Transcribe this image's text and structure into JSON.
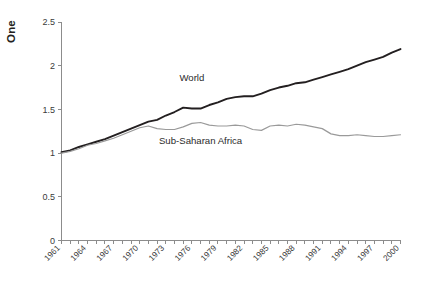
{
  "chart_data": {
    "type": "line",
    "title": "",
    "xlabel": "",
    "ylabel": "One",
    "ylim": [
      0,
      2.5
    ],
    "xlim": [
      1961,
      2000
    ],
    "grid": false,
    "legend_position": "inline-annotation",
    "ytick_labels": [
      "0",
      "0.5",
      "1",
      "1.5",
      "2",
      "2.5"
    ],
    "ytick_values": [
      0,
      0.5,
      1,
      1.5,
      2,
      2.5
    ],
    "x": [
      1961,
      1962,
      1963,
      1964,
      1965,
      1966,
      1967,
      1968,
      1969,
      1970,
      1971,
      1972,
      1973,
      1974,
      1975,
      1976,
      1977,
      1978,
      1979,
      1980,
      1981,
      1982,
      1983,
      1984,
      1985,
      1986,
      1987,
      1988,
      1989,
      1990,
      1991,
      1992,
      1993,
      1994,
      1995,
      1996,
      1997,
      1998,
      1999,
      2000
    ],
    "xtick_labels": [
      "1961",
      "1964",
      "1967",
      "1970",
      "1973",
      "1976",
      "1979",
      "1982",
      "1985",
      "1988",
      "1991",
      "1994",
      "1997",
      "2000"
    ],
    "xtick_values": [
      1961,
      1964,
      1967,
      1970,
      1973,
      1976,
      1979,
      1982,
      1985,
      1988,
      1991,
      1994,
      1997,
      2000
    ],
    "series": [
      {
        "name": "World",
        "color": "#231f20",
        "width": 1.9,
        "label_x": 1976,
        "label_y": 1.82,
        "values": [
          1.01,
          1.03,
          1.07,
          1.1,
          1.13,
          1.16,
          1.2,
          1.24,
          1.28,
          1.32,
          1.36,
          1.38,
          1.43,
          1.47,
          1.52,
          1.51,
          1.51,
          1.55,
          1.58,
          1.62,
          1.64,
          1.65,
          1.65,
          1.68,
          1.72,
          1.75,
          1.77,
          1.8,
          1.81,
          1.84,
          1.87,
          1.9,
          1.93,
          1.96,
          2.0,
          2.04,
          2.07,
          2.1,
          2.15,
          2.19
        ]
      },
      {
        "name": "Sub-Saharan Africa",
        "color": "#9a9a9a",
        "width": 1.2,
        "label_x": 1977,
        "label_y": 1.1,
        "values": [
          1.0,
          1.02,
          1.05,
          1.09,
          1.11,
          1.14,
          1.17,
          1.21,
          1.25,
          1.29,
          1.31,
          1.28,
          1.27,
          1.27,
          1.3,
          1.34,
          1.35,
          1.32,
          1.31,
          1.31,
          1.32,
          1.31,
          1.27,
          1.26,
          1.31,
          1.32,
          1.31,
          1.33,
          1.32,
          1.3,
          1.28,
          1.22,
          1.2,
          1.2,
          1.21,
          1.2,
          1.19,
          1.19,
          1.2,
          1.21
        ]
      }
    ]
  }
}
